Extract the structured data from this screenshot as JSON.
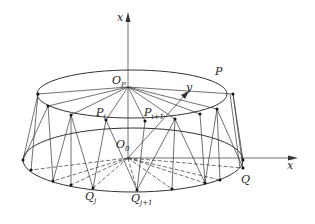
{
  "figure": {
    "labels": {
      "axis_vertical": "x",
      "axis_horizontal": "x",
      "axis_y": "y",
      "top_center": "O",
      "top_center_sub": "P",
      "bottom_center": "O",
      "bottom_center_sub": "0",
      "top_curve": "P",
      "p_i": "P",
      "p_i_sub": "i",
      "p_i1": "P",
      "p_i1_sub": "i+1",
      "q_j": "Q",
      "q_j_sub": "j",
      "q_j1": "Q",
      "q_j1_sub": "j+1",
      "bottom_point": "Q"
    },
    "colors": {
      "line": "#333333",
      "background": "#ffffff"
    }
  }
}
